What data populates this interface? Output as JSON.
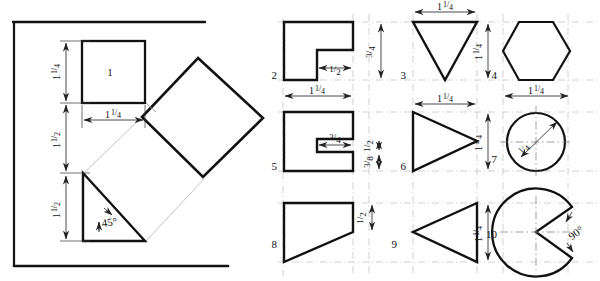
{
  "page": {
    "background_color": "#ffffff",
    "line_color": "#111111",
    "construction_line_color": "#9a9a9a",
    "dimension_line_color": "#333333"
  },
  "left_panel": {
    "name": "rotation-construction-panel",
    "border_note": "open frame: top rule and bottom rule",
    "figures": [
      {
        "id": "square-upright",
        "label": "1",
        "shape": "square",
        "dimensions": [
          {
            "name": "square-height",
            "value": "1¼",
            "numerator": "1",
            "denominator": "4",
            "whole": "1",
            "orientation": "vertical"
          },
          {
            "name": "square-width",
            "value": "1¼",
            "numerator": "1",
            "denominator": "4",
            "whole": "1",
            "orientation": "horizontal"
          }
        ]
      },
      {
        "id": "square-rotated",
        "label": "",
        "shape": "diamond",
        "dimensions": []
      },
      {
        "id": "right-triangle",
        "label": "",
        "shape": "right-triangle",
        "dimensions": [
          {
            "name": "triangle-height",
            "value": "1½",
            "whole": "1",
            "numerator": "1",
            "denominator": "2",
            "orientation": "vertical"
          },
          {
            "name": "triangle-angle",
            "value": "45°",
            "orientation": "angle"
          }
        ]
      }
    ],
    "vertical_stack_dimensions": [
      {
        "name": "dim-top-1-4",
        "whole": "1",
        "numerator": "1",
        "denominator": "4"
      },
      {
        "name": "dim-mid-1-2",
        "whole": "1",
        "numerator": "1",
        "denominator": "2"
      },
      {
        "name": "dim-bottom-1-2",
        "whole": "1",
        "numerator": "1",
        "denominator": "2"
      }
    ]
  },
  "right_panel": {
    "name": "numbered-shape-grid",
    "rows": 3,
    "cols": 3,
    "figures": [
      {
        "number": "2",
        "shape": "notched-square",
        "dimensions": [
          {
            "name": "notch-width",
            "whole": "",
            "numerator": "1",
            "denominator": "2",
            "orientation": "horizontal"
          },
          {
            "name": "notch-height",
            "whole": "",
            "numerator": "3",
            "denominator": "4",
            "orientation": "vertical"
          },
          {
            "name": "overall-width",
            "whole": "1",
            "numerator": "1",
            "denominator": "4",
            "orientation": "horizontal"
          }
        ]
      },
      {
        "number": "3",
        "shape": "inverted-triangle",
        "dimensions": [
          {
            "name": "top-width",
            "whole": "1",
            "numerator": "1",
            "denominator": "4",
            "orientation": "horizontal"
          },
          {
            "name": "height",
            "whole": "1",
            "numerator": "1",
            "denominator": "4",
            "orientation": "vertical"
          }
        ]
      },
      {
        "number": "4",
        "shape": "hexagon",
        "dimensions": [
          {
            "name": "across-flats",
            "whole": "1",
            "numerator": "1",
            "denominator": "4",
            "orientation": "horizontal"
          }
        ]
      },
      {
        "number": "5",
        "shape": "c-channel",
        "dimensions": [
          {
            "name": "slot-depth",
            "whole": "",
            "numerator": "3",
            "denominator": "4",
            "orientation": "horizontal"
          },
          {
            "name": "slot-height",
            "whole": "",
            "numerator": "1",
            "denominator": "2",
            "orientation": "vertical"
          },
          {
            "name": "lower-leg",
            "whole": "",
            "numerator": "3",
            "denominator": "8",
            "orientation": "vertical"
          }
        ]
      },
      {
        "number": "6",
        "shape": "right-pointing-triangle",
        "dimensions": [
          {
            "name": "width",
            "whole": "1",
            "numerator": "1",
            "denominator": "4",
            "orientation": "horizontal"
          },
          {
            "name": "height",
            "whole": "1",
            "numerator": "1",
            "denominator": "4",
            "orientation": "vertical"
          }
        ]
      },
      {
        "number": "7",
        "shape": "circle",
        "dimensions": [
          {
            "name": "radius",
            "whole": "",
            "numerator": "1",
            "denominator": "4",
            "orientation": "diagonal"
          }
        ]
      },
      {
        "number": "8",
        "shape": "right-trapezoid",
        "dimensions": [
          {
            "name": "right-edge-height",
            "whole": "",
            "numerator": "1",
            "denominator": "2",
            "orientation": "vertical"
          }
        ]
      },
      {
        "number": "9",
        "shape": "left-pointing-triangle",
        "dimensions": [
          {
            "name": "height",
            "whole": "1",
            "numerator": "1",
            "denominator": "4",
            "orientation": "vertical"
          }
        ]
      },
      {
        "number": "10",
        "shape": "pac-man-sector",
        "dimensions": [
          {
            "name": "notch-angle",
            "value": "90°",
            "orientation": "angle"
          }
        ]
      }
    ]
  }
}
